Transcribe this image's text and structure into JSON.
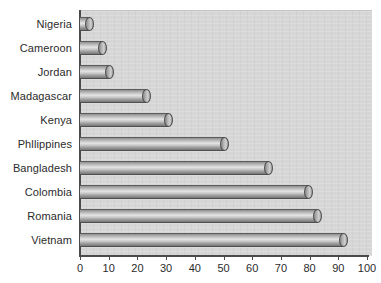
{
  "chart_data": {
    "type": "bar",
    "orientation": "horizontal",
    "title": "",
    "xlabel": "",
    "ylabel": "",
    "xlim": [
      0,
      100
    ],
    "xticks": [
      0,
      10,
      20,
      30,
      40,
      50,
      60,
      70,
      80,
      90,
      100
    ],
    "grid": false,
    "legend": null,
    "categories": [
      "Nigeria",
      "Cameroon",
      "Jordan",
      "Madagascar",
      "Kenya",
      "Phllippines",
      "Bangladesh",
      "Colombia",
      "Romania",
      "Vietnam"
    ],
    "values": [
      4.5,
      9,
      11.5,
      24.5,
      32,
      51.5,
      67,
      81,
      84,
      93
    ]
  },
  "style": {
    "plot_background": "#d6d6d6",
    "page_background": "#ffffff",
    "axis_color": "#4a4a4a",
    "bar_light": "#e4e4e4",
    "bar_dark": "#767676",
    "text_color": "#2b2b2b"
  }
}
